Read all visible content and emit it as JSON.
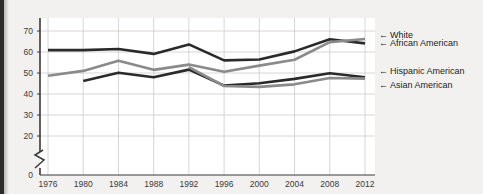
{
  "figure": {
    "name": "voter-turnout-line-chart",
    "background_color": "#f2f1ef",
    "plot_background_color": "#ffffff",
    "gridline_color": "#cccccc",
    "axis_color": "#3a3a3a"
  },
  "axes": {
    "y_tick_labels": [
      "70",
      "60",
      "50",
      "40",
      "30",
      "20",
      "0"
    ],
    "x_tick_labels": [
      "1976",
      "1980",
      "1984",
      "1988",
      "1992",
      "1996",
      "2000",
      "2004",
      "2008",
      "2012"
    ],
    "axis_break_symbol": "zigzag",
    "y_label": "",
    "x_label": ""
  },
  "legend": {
    "position": "right",
    "arrow_glyph": "←",
    "entries": [
      {
        "label": "White",
        "color": "#2a2a2a"
      },
      {
        "label": "African American",
        "color": "#8a8a8a"
      },
      {
        "label": "Hispanic American",
        "color": "#2a2a2a"
      },
      {
        "label": "Asian American",
        "color": "#8a8a8a"
      }
    ]
  },
  "chart_data": {
    "type": "line",
    "title": "",
    "subtitle": "",
    "xlabel": "",
    "ylabel": "",
    "x": [
      1976,
      1980,
      1984,
      1988,
      1992,
      1996,
      2000,
      2004,
      2008,
      2012
    ],
    "xlim": [
      1974,
      2014
    ],
    "ylim": [
      0,
      75
    ],
    "y_ticks": [
      20,
      30,
      40,
      50,
      60,
      70
    ],
    "y_axis_break_between": [
      0,
      20
    ],
    "grid": true,
    "legend_position": "right",
    "series": [
      {
        "name": "White",
        "color": "#2a2a2a",
        "x": [
          1976,
          1980,
          1984,
          1988,
          1992,
          1996,
          2000,
          2004,
          2008,
          2012
        ],
        "values": [
          60.9,
          60.9,
          61.4,
          59.1,
          63.6,
          56.0,
          56.4,
          60.3,
          66.1,
          64.1
        ]
      },
      {
        "name": "African American",
        "color": "#8a8a8a",
        "x": [
          1976,
          1980,
          1984,
          1988,
          1992,
          1996,
          2000,
          2004,
          2008,
          2012
        ],
        "values": [
          48.7,
          51.0,
          55.8,
          51.5,
          54.0,
          50.6,
          53.5,
          56.3,
          64.7,
          66.2
        ]
      },
      {
        "name": "Hispanic American",
        "color": "#2a2a2a",
        "x": [
          1980,
          1984,
          1988,
          1992,
          1996,
          2000,
          2004,
          2008,
          2012
        ],
        "values": [
          46.2,
          50.1,
          48.0,
          51.6,
          44.0,
          45.1,
          47.2,
          49.9,
          48.0
        ]
      },
      {
        "name": "Asian American",
        "color": "#8a8a8a",
        "x": [
          1992,
          1996,
          2000,
          2004,
          2008,
          2012
        ],
        "values": [
          52.8,
          43.8,
          43.4,
          44.6,
          47.6,
          47.3
        ]
      }
    ]
  }
}
